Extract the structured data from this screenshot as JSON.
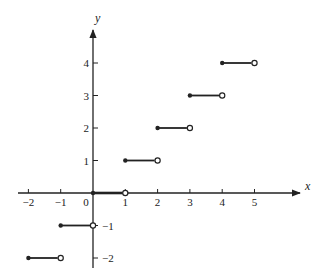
{
  "chart_data": {
    "type": "line",
    "title": "",
    "subtitle": "Step function y = [x] (greatest integer function)",
    "xlabel": "x",
    "ylabel": "y",
    "xlim": [
      -2,
      5
    ],
    "ylim": [
      -2,
      4
    ],
    "grid": false,
    "legend": null,
    "x_ticks": [
      -2,
      -1,
      0,
      1,
      2,
      3,
      4,
      5
    ],
    "x_tick_labels": [
      "−2",
      "−1",
      "0",
      "1",
      "2",
      "3",
      "4",
      "5"
    ],
    "y_ticks": [
      4,
      3,
      2,
      1,
      -1,
      -2
    ],
    "y_tick_labels": [
      "4",
      "3",
      "2",
      "1",
      "−1",
      "−2"
    ],
    "segments": [
      {
        "x_start": -2,
        "x_end": -1,
        "y": -2,
        "start": "closed",
        "end": "open"
      },
      {
        "x_start": -1,
        "x_end": 0,
        "y": -1,
        "start": "closed",
        "end": "open"
      },
      {
        "x_start": 0,
        "x_end": 1,
        "y": 0,
        "start": "closed",
        "end": "open"
      },
      {
        "x_start": 1,
        "x_end": 2,
        "y": 1,
        "start": "closed",
        "end": "open"
      },
      {
        "x_start": 2,
        "x_end": 3,
        "y": 2,
        "start": "closed",
        "end": "open"
      },
      {
        "x_start": 3,
        "x_end": 4,
        "y": 3,
        "start": "closed",
        "end": "open"
      },
      {
        "x_start": 4,
        "x_end": 5,
        "y": 4,
        "start": "closed",
        "end": "open"
      }
    ]
  },
  "layout": {
    "origin_px": [
      93,
      193
    ],
    "x_scale": 32.3,
    "y_scale": 32.5,
    "x_axis_px": [
      18,
      300
    ],
    "y_axis_px": [
      30,
      268
    ],
    "colors": {
      "ink": "#222222",
      "paper": "#ffffff"
    }
  }
}
